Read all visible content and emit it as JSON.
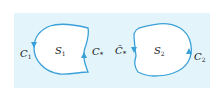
{
  "diagram": {
    "colors": {
      "background": "#ffffff",
      "panel": "#e3f5fb",
      "curve": "#3aa0d8",
      "region": "#ffffff",
      "text": "#1a1a1a"
    },
    "regions": [
      {
        "name": "S",
        "subscript": "1"
      },
      {
        "name": "S",
        "subscript": "2"
      }
    ],
    "curves": [
      {
        "name": "C",
        "subscript": "1",
        "position": "left of S1"
      },
      {
        "name": "C",
        "subscript": "*",
        "position": "right of S1"
      },
      {
        "name": "C̄",
        "subscript": "*",
        "position": "left of S2"
      },
      {
        "name": "C",
        "subscript": "2",
        "position": "right of S2"
      }
    ]
  }
}
